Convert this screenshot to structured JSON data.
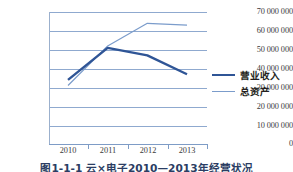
{
  "chart_data": {
    "type": "line",
    "title": "",
    "xlabel": "",
    "ylabel": "",
    "categories": [
      "2010",
      "2011",
      "2012",
      "2013"
    ],
    "x": [
      "2010",
      "2011",
      "2012",
      "2013"
    ],
    "ylim": [
      0,
      70000000
    ],
    "ytick_labels": [
      "70 000 000",
      "60 000 000",
      "50 000 000",
      "40 000 000",
      "30 000 000",
      "20 000 000",
      "10 000 000",
      "0"
    ],
    "ytick_values": [
      70000000,
      60000000,
      50000000,
      40000000,
      30000000,
      20000000,
      10000000,
      0
    ],
    "ytick_step": 10000000,
    "grid": true,
    "grid_axis": "y",
    "legend_position": "right",
    "series": [
      {
        "name": "营业收入",
        "values": [
          34000000,
          51000000,
          47000000,
          37000000
        ],
        "color": "#2f5596",
        "width": 2.4
      },
      {
        "name": "总资产",
        "values": [
          31000000,
          52000000,
          64000000,
          63000000
        ],
        "color": "#7b9ccb",
        "width": 1.2
      }
    ]
  },
  "legend": {
    "items": [
      {
        "label": "营业收入",
        "swatch": "thick-dark-blue-line"
      },
      {
        "label": "总资产",
        "swatch": "thin-light-blue-line"
      }
    ]
  },
  "caption": {
    "text": "图1-1-1 云×电子2010—2013年经营状况"
  },
  "colors": {
    "series_revenue": "#2f5596",
    "series_assets": "#7b9ccb",
    "gridline": "#8fa9cf",
    "axis": "#7e9cc6",
    "tick_text": "#3a3a3a",
    "legend_text": "#241f20",
    "caption_text": "#2b3d63",
    "background": "#ffffff"
  }
}
